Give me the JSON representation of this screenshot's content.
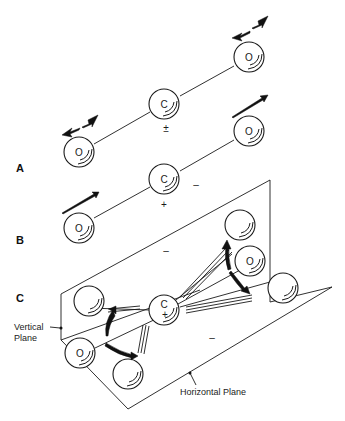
{
  "sections": {
    "a": {
      "label": "A",
      "charge_center": "±"
    },
    "b": {
      "label": "B",
      "charge_center": "+",
      "charge_side": "–"
    },
    "c": {
      "label": "C",
      "charge_center": "+",
      "charge_upper": "–",
      "charge_lower": "–"
    }
  },
  "atoms": {
    "carbon": "C",
    "oxygen": "O"
  },
  "annotations": {
    "vertical_plane": [
      "Vertical",
      "Plane"
    ],
    "horizontal_plane": "Horizontal Plane"
  }
}
